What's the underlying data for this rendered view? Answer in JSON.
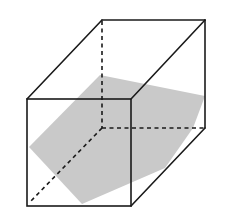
{
  "diagram": {
    "title": "",
    "colors": {
      "edge": "#1a1a1a",
      "section_fill": "#c9c9c9",
      "background": "#ffffff"
    },
    "vertices": {
      "front_top_left": "A",
      "front_top_right": "B",
      "front_bottom_right": "C",
      "front_bottom_left": "D",
      "back_top_left": "E",
      "back_top_right": "F",
      "back_bottom_right": "G",
      "back_bottom_left_hidden": "H"
    },
    "visible_edges": [
      "front-top",
      "front-right",
      "front-bottom",
      "front-left",
      "top-left-depth",
      "top-right-depth",
      "back-top",
      "back-right",
      "bottom-right-depth"
    ],
    "hidden_edges": [
      "back-left-vertical",
      "back-bottom",
      "bottom-left-depth"
    ],
    "cross_section": {
      "shape": "hexagon",
      "shaded": true
    }
  }
}
